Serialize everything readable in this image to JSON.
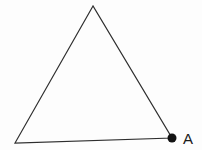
{
  "diagram": {
    "type": "geometry-figure",
    "background_color": "#fdfdfd",
    "stroke_color": "#2e2e2e",
    "stroke_width": 1.2,
    "triangle": {
      "fill": "none",
      "vertices": [
        {
          "name": "apex",
          "x": 93,
          "y": 6
        },
        {
          "name": "bottom-left",
          "x": 15,
          "y": 143
        },
        {
          "name": "bottom-right",
          "x": 172,
          "y": 138
        }
      ]
    },
    "point": {
      "label": "A",
      "x": 172,
      "y": 138,
      "radius": 4.5,
      "fill": "#121212"
    },
    "label": {
      "text": "A",
      "x": 183,
      "y": 144,
      "font_size": 15,
      "color": "#1a1a1a"
    }
  }
}
